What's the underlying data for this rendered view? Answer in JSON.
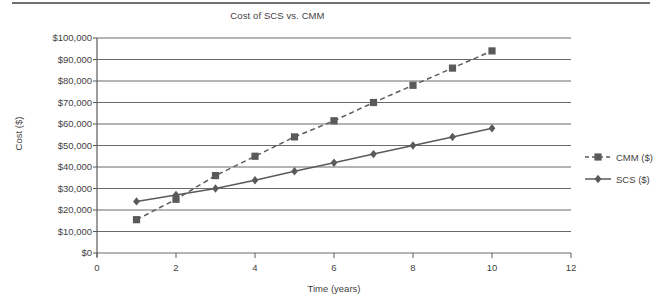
{
  "chart_data": {
    "type": "line",
    "title": "Cost of SCS vs. CMM",
    "xlabel": "Time (years)",
    "ylabel": "Cost ($)",
    "xlim": [
      0,
      12
    ],
    "ylim": [
      0,
      100000
    ],
    "grid": "horizontal",
    "legend_position": "right",
    "x": [
      1,
      2,
      3,
      4,
      5,
      6,
      7,
      8,
      9,
      10
    ],
    "xticks": [
      0,
      2,
      4,
      6,
      8,
      10,
      12
    ],
    "xtick_labels": [
      "0",
      "2",
      "4",
      "6",
      "8",
      "10",
      "12"
    ],
    "yticks": [
      0,
      10000,
      20000,
      30000,
      40000,
      50000,
      60000,
      70000,
      80000,
      90000,
      100000
    ],
    "ytick_labels": [
      "$0",
      "$10,000",
      "$20,000",
      "$30,000",
      "$40,000",
      "$50,000",
      "$60,000",
      "$70,000",
      "$80,000",
      "$90,000",
      "$100,000"
    ],
    "series": [
      {
        "name": "CMM ($)",
        "marker": "square",
        "linestyle": "dashed",
        "color": "#5a5a5a",
        "values": [
          15500,
          25000,
          36000,
          45000,
          54000,
          61500,
          70000,
          78000,
          86000,
          94000
        ]
      },
      {
        "name": "SCS ($)",
        "marker": "diamond",
        "linestyle": "solid",
        "color": "#5a5a5a",
        "values": [
          24000,
          27000,
          30000,
          33800,
          38000,
          42000,
          46000,
          50000,
          54000,
          58000
        ]
      }
    ]
  },
  "legend": {
    "items": [
      {
        "label": "CMM ($)"
      },
      {
        "label": "SCS ($)"
      }
    ]
  },
  "colors": {
    "axis": "#5a5a5a",
    "grid": "#6b6b6b",
    "text": "#3f3f3f",
    "series": "#5a5a5a",
    "rule": "#6f6f6f"
  }
}
